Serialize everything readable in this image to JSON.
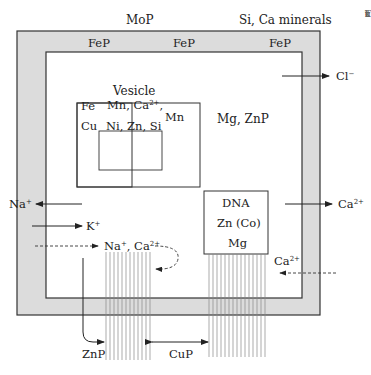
{
  "outside_labels": {
    "top_left": "MoP",
    "top_right": "Si, Ca minerals"
  },
  "wall_labels": [
    "FeP",
    "FeP",
    "FeP"
  ],
  "vesicle": {
    "title": "Vesicle",
    "left_line1": "Fe",
    "left_line2": "Cu",
    "inner_line1": "Mn, Ca",
    "inner_line1_sup": "2+",
    "inner_line1_tail": ",",
    "inner_line2": "Ni, Zn, Si",
    "right": "Mn"
  },
  "cytoplasm_label": "Mg, ZnP",
  "dna_box": {
    "line1": "DNA",
    "line2": "Zn (Co)",
    "line3": "Mg"
  },
  "ion_flows": [
    {
      "ion": "Cl",
      "sup": "−",
      "direction": "out",
      "style": "solid"
    },
    {
      "ion": "Na",
      "sup": "+",
      "direction": "out",
      "style": "solid"
    },
    {
      "ion": "K",
      "sup": "+",
      "direction": "in",
      "style": "solid"
    },
    {
      "ion": "Na",
      "sup": "+",
      "ion2": "Ca",
      "sup2": "2+",
      "direction": "in",
      "style": "dashed"
    },
    {
      "ion": "Ca",
      "sup": "2+",
      "direction": "out",
      "style": "solid"
    },
    {
      "ion": "Ca",
      "sup": "2+",
      "direction": "in",
      "style": "dashed"
    }
  ],
  "bottom_labels": {
    "left": "ZnP",
    "middle": "CuP"
  },
  "edge_text_fragments": [
    "k",
    "T",
    "c",
    "r",
    "u",
    "r",
    "t"
  ],
  "colors": {
    "wall_fill": "#dcdcdc",
    "line": "#333333",
    "fiber": "#777777"
  }
}
